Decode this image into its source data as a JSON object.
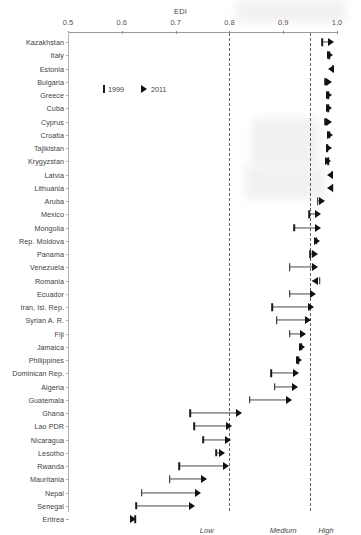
{
  "chart_data": {
    "type": "scatter",
    "title": "EDI",
    "xlabel": "EDI",
    "ylabel": "",
    "xlim": [
      0.5,
      1.0
    ],
    "grid": false,
    "legend_position": "upper-left-inside",
    "tick_labels": [
      "0.5",
      "0.6",
      "0.7",
      "0.8",
      "0.9",
      "1.0"
    ],
    "tick_values": [
      0.5,
      0.6,
      0.7,
      0.8,
      0.9,
      1.0
    ],
    "threshold_lines": [
      0.8,
      0.95
    ],
    "zone_labels": [
      {
        "label": "Low",
        "x": 0.745
      },
      {
        "label": "Medium",
        "x": 0.875
      },
      {
        "label": "High",
        "x": 0.965
      }
    ],
    "legend": [
      {
        "label": "1999",
        "marker": "bar"
      },
      {
        "label": "2011",
        "marker": "arrow"
      }
    ],
    "series": [
      {
        "name": "1999",
        "marker": "bar"
      },
      {
        "name": "2011",
        "marker": "arrow"
      }
    ],
    "categories": [
      "Kazakhstan",
      "Italy",
      "Estonia",
      "Bulgaria",
      "Greece",
      "Cuba",
      "Cyprus",
      "Croatia",
      "Tajikistan",
      "Krygyzstan",
      "Latvia",
      "Lithuania",
      "Aruba",
      "Mexico",
      "Mongolia",
      "Rep. Moldova",
      "Panama",
      "Venezuela",
      "Romania",
      "Ecuador",
      "Iran, Isl. Rep.",
      "Syrian A. R.",
      "Fiji",
      "Jamaica",
      "Philippines",
      "Dominican Rep.",
      "Algeria",
      "Guatemala",
      "Ghana",
      "Lao PDR",
      "Nicaragua",
      "Lesotho",
      "Rwanda",
      "Mauritania",
      "Nepal",
      "Senegal",
      "Eritrea"
    ],
    "rows": [
      {
        "country": "Kazakhstan",
        "v1999": 0.972,
        "v2011": 0.996,
        "direction": "right"
      },
      {
        "country": "Italy",
        "v1999": 0.985,
        "v2011": 0.994,
        "direction": "right"
      },
      {
        "country": "Estonia",
        "v1999": 0.992,
        "v2011": 0.984,
        "direction": "left"
      },
      {
        "country": "Bulgaria",
        "v1999": 0.978,
        "v2011": 0.992,
        "direction": "right"
      },
      {
        "country": "Cyprus",
        "v1999": 0.978,
        "v2011": 0.992,
        "direction": "right"
      },
      {
        "country": "Greece",
        "v1999": 0.984,
        "v2011": 0.992,
        "direction": "right"
      },
      {
        "country": "Cuba",
        "v1999": 0.984,
        "v2011": 0.992,
        "direction": "right"
      },
      {
        "country": "Croatia",
        "v1999": 0.986,
        "v2011": 0.993,
        "direction": "right"
      },
      {
        "country": "Tajikistan",
        "v1999": 0.982,
        "v2011": 0.991,
        "direction": "right"
      },
      {
        "country": "Krygyzstan",
        "v1999": 0.984,
        "v2011": 0.99,
        "direction": "right"
      },
      {
        "country": "Latvia",
        "v1999": 0.99,
        "v2011": 0.982,
        "direction": "left"
      },
      {
        "country": "Lithuania",
        "v1999": 0.992,
        "v2011": 0.981,
        "direction": "left"
      },
      {
        "country": "Aruba",
        "v1999": 0.964,
        "v2011": 0.979,
        "direction": "right"
      },
      {
        "country": "Mexico",
        "v1999": 0.948,
        "v2011": 0.972,
        "direction": "right"
      },
      {
        "country": "Mongolia",
        "v1999": 0.921,
        "v2011": 0.971,
        "direction": "right"
      },
      {
        "country": "Rep. Moldova",
        "v1999": 0.962,
        "v2011": 0.97,
        "direction": "right"
      },
      {
        "country": "Panama",
        "v1999": 0.95,
        "v2011": 0.966,
        "direction": "right"
      },
      {
        "country": "Venezuela",
        "v1999": 0.912,
        "v2011": 0.965,
        "direction": "right"
      },
      {
        "country": "Romania",
        "v1999": 0.968,
        "v2011": 0.953,
        "direction": "left"
      },
      {
        "country": "Ecuador",
        "v1999": 0.912,
        "v2011": 0.961,
        "direction": "right"
      },
      {
        "country": "Iran, Isl. Rep.",
        "v1999": 0.88,
        "v2011": 0.958,
        "direction": "right"
      },
      {
        "country": "Syrian A. R.",
        "v1999": 0.888,
        "v2011": 0.952,
        "direction": "right"
      },
      {
        "country": "Fiji",
        "v1999": 0.912,
        "v2011": 0.944,
        "direction": "right"
      },
      {
        "country": "Jamaica",
        "v1999": 0.934,
        "v2011": 0.941,
        "direction": "right"
      },
      {
        "country": "Philippines",
        "v1999": 0.928,
        "v2011": 0.936,
        "direction": "right"
      },
      {
        "country": "Dominican Rep.",
        "v1999": 0.878,
        "v2011": 0.93,
        "direction": "right"
      },
      {
        "country": "Algeria",
        "v1999": 0.884,
        "v2011": 0.928,
        "direction": "right"
      },
      {
        "country": "Guatemala",
        "v1999": 0.838,
        "v2011": 0.918,
        "direction": "right"
      },
      {
        "country": "Ghana",
        "v1999": 0.727,
        "v2011": 0.825,
        "direction": "right"
      },
      {
        "country": "Lao PDR",
        "v1999": 0.735,
        "v2011": 0.805,
        "direction": "right"
      },
      {
        "country": "Nicaragua",
        "v1999": 0.751,
        "v2011": 0.803,
        "direction": "right"
      },
      {
        "country": "Rwanda",
        "v1999": 0.707,
        "v2011": 0.8,
        "direction": "right"
      },
      {
        "country": "Lesotho",
        "v1999": 0.776,
        "v2011": 0.793,
        "direction": "right"
      },
      {
        "country": "Mauritania",
        "v1999": 0.689,
        "v2011": 0.76,
        "direction": "right"
      },
      {
        "country": "Nepal",
        "v1999": 0.637,
        "v2011": 0.748,
        "direction": "right"
      },
      {
        "country": "Senegal",
        "v1999": 0.627,
        "v2011": 0.737,
        "direction": "right"
      },
      {
        "country": "Eritrea",
        "v1999": 0.625,
        "v2011": 0.628,
        "direction": "right"
      }
    ]
  },
  "layout": {
    "plot_left_px": 68,
    "plot_right_px": 337,
    "row_start_px": 42,
    "row_step_px": 13.25
  }
}
